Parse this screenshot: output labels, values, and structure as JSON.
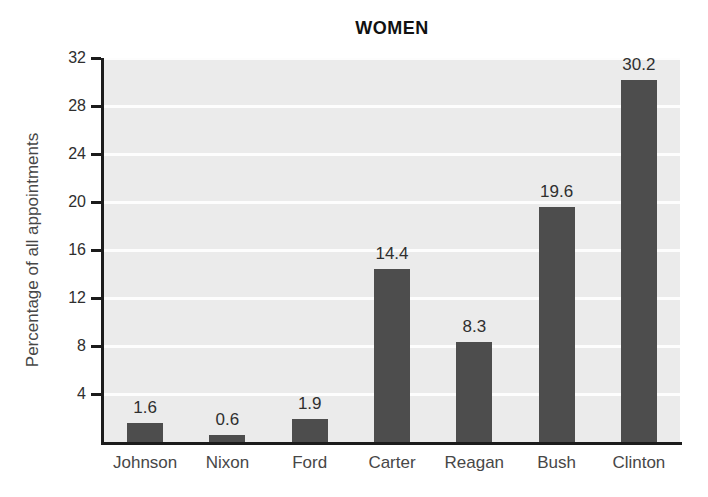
{
  "chart_data": {
    "type": "bar",
    "title": "WOMEN",
    "xlabel": "",
    "ylabel": "Percentage of all appointments",
    "categories": [
      "Johnson",
      "Nixon",
      "Ford",
      "Carter",
      "Reagan",
      "Bush",
      "Clinton"
    ],
    "values": [
      1.6,
      0.6,
      1.9,
      14.4,
      8.3,
      19.6,
      30.2
    ],
    "value_labels": [
      "1.6",
      "0.6",
      "1.9",
      "14.4",
      "8.3",
      "19.6",
      "30.2"
    ],
    "yticks": [
      4,
      8,
      12,
      16,
      20,
      24,
      28,
      32
    ],
    "ylim": [
      0,
      32
    ],
    "grid": true,
    "legend_position": "none",
    "colors": {
      "bar": "#4d4d4d",
      "plot_background": "#ebebeb",
      "gridline": "#fdfdfd",
      "axis": "#1c1c1c",
      "tick_label": "#2e2e2e",
      "category_label": "#474747",
      "value_label": "#2f2f2f",
      "title": "#111111"
    }
  }
}
